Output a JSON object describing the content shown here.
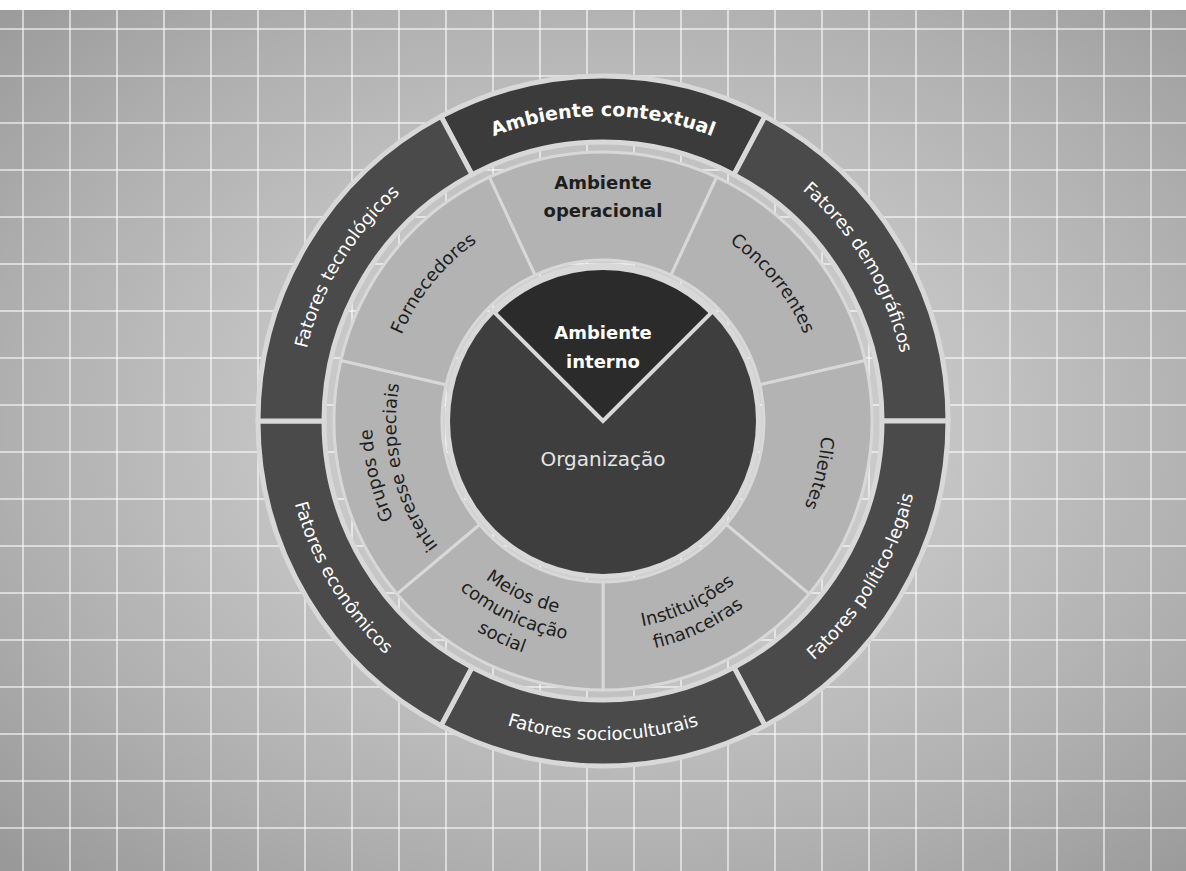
{
  "diagram": {
    "center": {
      "x": 603,
      "y": 431
    },
    "colors": {
      "background": "#bdbdbd",
      "outer_ring": "#4a4a4a",
      "outer_ring_top": "#3b3b3b",
      "operational_ring": "#b3b3b3",
      "inner_circle": "#3e3e3e",
      "inner_wedge": "#2b2b2b",
      "separator": "#d8d8d8",
      "light_text": "#ffffff",
      "dark_text": "#1e1e1e"
    },
    "outer_ring": {
      "r_outer": 345,
      "r_inner": 279,
      "segments": [
        {
          "label": "Ambiente contextual",
          "start": -118,
          "end": -62,
          "bold": true,
          "top": true
        },
        {
          "label": "Fatores demográficos",
          "start": -62,
          "end": 0
        },
        {
          "label": "Fatores político-legais",
          "start": 0,
          "end": 62
        },
        {
          "label": "Fatores socioculturais",
          "start": 62,
          "end": 118
        },
        {
          "label": "Fatores econômicos",
          "start": 118,
          "end": 180
        },
        {
          "label": "Fatores tecnológicos",
          "start": 180,
          "end": 242
        }
      ]
    },
    "operational_ring": {
      "r_outer": 269,
      "r_inner": 161,
      "segments": [
        {
          "label": [
            "Ambiente",
            "operacional"
          ],
          "start": -115,
          "end": -65,
          "bold": true,
          "mode": "horizontal"
        },
        {
          "label": [
            "Concorrentes"
          ],
          "start": -65,
          "end": -13
        },
        {
          "label": [
            "Clientes"
          ],
          "start": -13,
          "end": 40
        },
        {
          "label": [
            "Instituições",
            "financeiras"
          ],
          "start": 40,
          "end": 90
        },
        {
          "label": [
            "Meios de",
            "comunicação",
            "social"
          ],
          "start": 90,
          "end": 140
        },
        {
          "label": [
            "Grupos de",
            "interesse especiais"
          ],
          "start": 140,
          "end": 193
        },
        {
          "label": [
            "Fornecedores"
          ],
          "start": 193,
          "end": 245
        }
      ]
    },
    "inner_circle": {
      "r": 153,
      "label": "Organização",
      "wedge": {
        "label": [
          "Ambiente",
          "interno"
        ],
        "start": -135,
        "end": -45
      }
    }
  }
}
